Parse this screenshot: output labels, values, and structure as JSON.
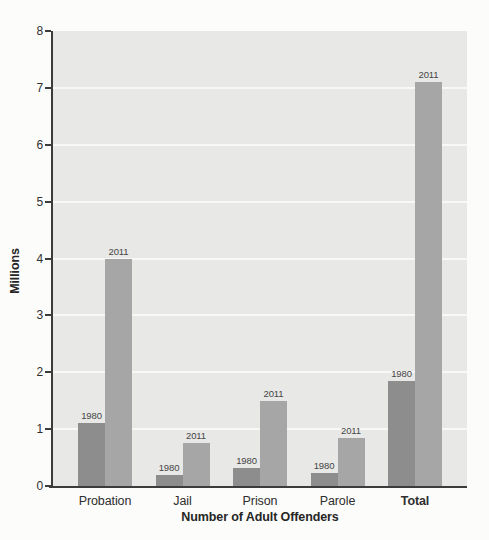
{
  "chart_data": {
    "type": "bar",
    "title": "",
    "xlabel": "Number of Adult Offenders",
    "ylabel": "Millions",
    "categories": [
      "Probation",
      "Jail",
      "Prison",
      "Parole",
      "Total"
    ],
    "series": [
      {
        "name": "1980",
        "color": "#8d8d8d",
        "values": [
          1.1,
          0.2,
          0.32,
          0.22,
          1.84
        ]
      },
      {
        "name": "2011",
        "color": "#a6a6a6",
        "values": [
          4.0,
          0.75,
          1.5,
          0.85,
          7.1
        ]
      }
    ],
    "bar_value_labels": "series year shown above each bar",
    "ylim": [
      0,
      8
    ],
    "yticks": [
      0,
      1,
      2,
      3,
      4,
      5,
      6,
      7,
      8
    ],
    "grid": "horizontal",
    "legend": "none",
    "bold_categories": [
      "Total"
    ]
  },
  "colors": {
    "page_background": "#fcfcfa",
    "plot_background": "#e8e8e6",
    "gridline": "#f8f8f6",
    "axis": "#3c3c3c",
    "tick_text": "#303030",
    "category_text": "#2e2e2e",
    "year_label_text": "#454545",
    "axis_title_text": "#262626"
  }
}
